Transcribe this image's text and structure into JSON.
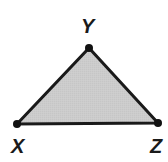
{
  "figure": {
    "kind": "geometry-diagram",
    "shape": "triangle",
    "background_color": "#ffffff",
    "fill_color": "#cccccc",
    "stroke_color": "#1a1a1a",
    "stroke_width": 3,
    "vertex_dot_color": "#111111",
    "vertex_dot_radius": 4,
    "vertices": [
      {
        "id": "X",
        "label": "X",
        "x": 17,
        "y": 124,
        "label_x": 11,
        "label_y": 136,
        "label_position": "below-left"
      },
      {
        "id": "Y",
        "label": "Y",
        "x": 89,
        "y": 48,
        "label_x": 81,
        "label_y": 16,
        "label_position": "above"
      },
      {
        "id": "Z",
        "label": "Z",
        "x": 158,
        "y": 123,
        "label_x": 150,
        "label_y": 136,
        "label_position": "below-right"
      }
    ],
    "edges": [
      {
        "id": "XY",
        "from": "X",
        "to": "Y"
      },
      {
        "id": "YZ",
        "from": "Y",
        "to": "Z"
      },
      {
        "id": "ZX",
        "from": "Z",
        "to": "X"
      }
    ]
  }
}
